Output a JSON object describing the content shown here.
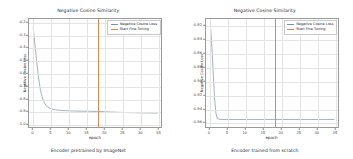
{
  "figure": {
    "panels": [
      {
        "caption": "Encoder pretrained by ImageNet",
        "chart_data": {
          "type": "line",
          "title": "Negative Cosine Similarity",
          "xlabel": "epoch",
          "ylabel": "Negative Cosine Loss",
          "xlim": [
            -1.2,
            36
          ],
          "ylim": [
            -1.03,
            -0.17
          ],
          "xticks": [
            "0",
            "5",
            "10",
            "15",
            "20",
            "25",
            "30",
            "35"
          ],
          "xtick_values": [
            0,
            5,
            10,
            15,
            20,
            25,
            30,
            35
          ],
          "yticks": [
            "-0.2",
            "-0.3",
            "-0.4",
            "-0.5",
            "-0.6",
            "-0.7",
            "-0.8",
            "-0.9",
            "-1.0"
          ],
          "ytick_values": [
            -0.2,
            -0.3,
            -0.4,
            -0.5,
            -0.6,
            -0.7,
            -0.8,
            -0.9,
            -1.0
          ],
          "grid": true,
          "legend_position": "upper right",
          "series": [
            {
              "name": "Negative Cosine Loss",
              "color": "#7a8fa6",
              "x": [
                0,
                0.5,
                1,
                1.5,
                2,
                2.5,
                3,
                3.5,
                4,
                5,
                6,
                7,
                8,
                9,
                10,
                12,
                14,
                16,
                18,
                20,
                22,
                24,
                26,
                28,
                30,
                32,
                34,
                35
              ],
              "values": [
                -0.24,
                -0.38,
                -0.52,
                -0.64,
                -0.73,
                -0.79,
                -0.83,
                -0.855,
                -0.87,
                -0.885,
                -0.892,
                -0.896,
                -0.898,
                -0.9,
                -0.901,
                -0.903,
                -0.904,
                -0.905,
                -0.906,
                -0.908,
                -0.911,
                -0.913,
                -0.915,
                -0.916,
                -0.917,
                -0.918,
                -0.919,
                -0.919
              ]
            }
          ],
          "annotations": [
            {
              "name": "Start Fine Tuning",
              "type": "vline",
              "color": "#d98a4f",
              "x": 18
            }
          ]
        }
      },
      {
        "caption": "Encoder trained from scratch",
        "chart_data": {
          "type": "line",
          "title": "Negative Cosine Similarity",
          "xlabel": "epoch",
          "ylabel": "Negative Cosine Loss",
          "xlim": [
            -1.2,
            36
          ],
          "ylim": [
            -0.968,
            -0.81
          ],
          "xticks": [
            "0",
            "5",
            "10",
            "15",
            "20",
            "25",
            "30",
            "35"
          ],
          "xtick_values": [
            0,
            5,
            10,
            15,
            20,
            25,
            30,
            35
          ],
          "yticks": [
            "-0.82",
            "-0.84",
            "-0.86",
            "-0.88",
            "-0.90",
            "-0.92",
            "-0.94",
            "-0.96"
          ],
          "ytick_values": [
            -0.82,
            -0.84,
            -0.86,
            -0.88,
            -0.9,
            -0.92,
            -0.94,
            -0.96
          ],
          "grid": true,
          "legend_position": "upper right",
          "series": [
            {
              "name": "Negative Cosine Loss",
              "color": "#7a8fa6",
              "x": [
                0,
                0.4,
                0.8,
                1.2,
                1.6,
                2,
                3,
                5,
                8,
                12,
                16,
                20,
                24,
                28,
                32,
                35
              ],
              "values": [
                -0.815,
                -0.845,
                -0.885,
                -0.925,
                -0.948,
                -0.956,
                -0.957,
                -0.957,
                -0.957,
                -0.957,
                -0.957,
                -0.957,
                -0.957,
                -0.957,
                -0.957,
                -0.957
              ]
            }
          ],
          "annotations": [
            {
              "name": "Start Fine Tuning",
              "type": "vline",
              "color": "#d98a4f",
              "x": 18
            }
          ]
        }
      }
    ]
  }
}
